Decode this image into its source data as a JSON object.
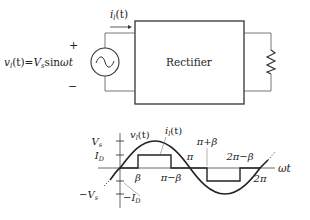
{
  "circuit": {
    "source_label": "v_l(t)=V_s sin ωt",
    "source_label_parts": {
      "v": "v",
      "sub": "l",
      "rest": "(t)=",
      "V": "V",
      "Vsub": "s",
      "sin": "sin",
      "wt": "ωt"
    },
    "plus": "+",
    "minus": "−",
    "current_label": {
      "i": "i",
      "sub": "l",
      "rest": "(t)"
    },
    "block_label": "Rectifier",
    "load": "resistor"
  },
  "waveform": {
    "voltage_label": {
      "v": "v",
      "sub": "l",
      "rest": "(t)"
    },
    "current_label": {
      "i": "i",
      "sub": "l",
      "rest": "(t)"
    },
    "y_ticks": [
      {
        "main": "V",
        "sub": "s"
      },
      {
        "main": "I",
        "sub": "D"
      },
      {
        "main": "−I",
        "sub": "D"
      },
      {
        "main": "−V",
        "sub": "s"
      }
    ],
    "x_marks": [
      "β",
      "π−β",
      "π",
      "π+β",
      "2π−β",
      "2π"
    ],
    "x_axis_label": "ωt"
  },
  "colors": {
    "line": "#222222",
    "light_line": "#555555",
    "background": "#ffffff"
  }
}
